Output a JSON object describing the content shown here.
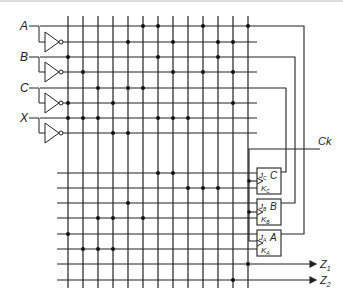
{
  "diagram": {
    "inputs": [
      {
        "label": "A",
        "y": 26,
        "ybar": 42
      },
      {
        "label": "B",
        "y": 57,
        "ybar": 72
      },
      {
        "label": "C",
        "y": 88,
        "ybar": 103
      },
      {
        "label": "X",
        "y": 118,
        "ybar": 133
      }
    ],
    "clock_label": "Ck",
    "flipflops": [
      {
        "name": "C",
        "j": "J",
        "j_sub": "C",
        "k": "K",
        "k_sub": "C",
        "out": "C"
      },
      {
        "name": "B",
        "j": "J",
        "j_sub": "B",
        "k": "K",
        "k_sub": "B",
        "out": "B"
      },
      {
        "name": "A",
        "j": "J",
        "j_sub": "A",
        "k": "K",
        "k_sub": "A",
        "out": "A"
      }
    ],
    "outputs": [
      {
        "label": "Z",
        "sub": "1"
      },
      {
        "label": "Z",
        "sub": "2"
      }
    ],
    "grid": {
      "vertical_x": [
        68,
        83,
        98,
        113,
        128,
        143,
        158,
        173,
        188,
        203,
        218,
        233,
        248
      ],
      "upper_rows_y": [
        26,
        42,
        57,
        72,
        88,
        103,
        118,
        133
      ],
      "lower_rows_y": [
        173,
        188,
        203,
        218,
        234,
        249,
        264,
        280
      ]
    },
    "upper_dots": [
      [
        143,
        26
      ],
      [
        158,
        26
      ],
      [
        203,
        26
      ],
      [
        248,
        26
      ],
      [
        128,
        42
      ],
      [
        173,
        42
      ],
      [
        218,
        42
      ],
      [
        233,
        42
      ],
      [
        68,
        57
      ],
      [
        158,
        57
      ],
      [
        218,
        57
      ],
      [
        83,
        72
      ],
      [
        173,
        72
      ],
      [
        203,
        72
      ],
      [
        233,
        72
      ],
      [
        98,
        88
      ],
      [
        128,
        88
      ],
      [
        143,
        88
      ],
      [
        68,
        103
      ],
      [
        113,
        103
      ],
      [
        233,
        103
      ],
      [
        68,
        118
      ],
      [
        83,
        118
      ],
      [
        98,
        118
      ],
      [
        158,
        118
      ],
      [
        173,
        118
      ],
      [
        188,
        118
      ],
      [
        113,
        133
      ],
      [
        128,
        133
      ]
    ],
    "lower_dots": [
      [
        158,
        173
      ],
      [
        173,
        173
      ],
      [
        188,
        188
      ],
      [
        203,
        188
      ],
      [
        218,
        188
      ],
      [
        128,
        203
      ],
      [
        98,
        218
      ],
      [
        113,
        218
      ],
      [
        143,
        218
      ],
      [
        68,
        234
      ],
      [
        83,
        249
      ],
      [
        98,
        249
      ],
      [
        113,
        249
      ],
      [
        248,
        264
      ],
      [
        233,
        280
      ]
    ]
  }
}
